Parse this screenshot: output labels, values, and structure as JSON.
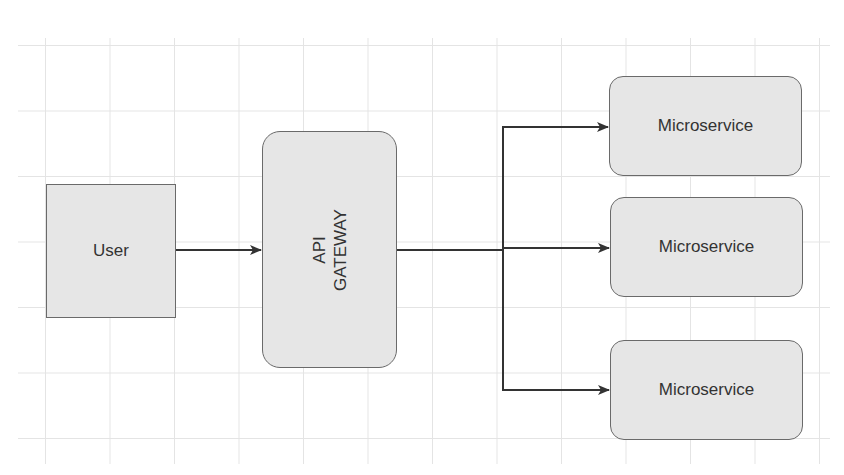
{
  "diagram": {
    "type": "architecture",
    "nodes": [
      {
        "id": "user",
        "label": "User",
        "shape": "rectangle"
      },
      {
        "id": "gateway",
        "label_line1": "API",
        "label_line2": "GATEWAY",
        "shape": "rounded-rectangle",
        "text_orientation": "vertical"
      },
      {
        "id": "ms1",
        "label": "Microservice",
        "shape": "rounded-rectangle"
      },
      {
        "id": "ms2",
        "label": "Microservice",
        "shape": "rounded-rectangle"
      },
      {
        "id": "ms3",
        "label": "Microservice",
        "shape": "rounded-rectangle"
      }
    ],
    "edges": [
      {
        "from": "user",
        "to": "gateway"
      },
      {
        "from": "gateway",
        "to": "ms1"
      },
      {
        "from": "gateway",
        "to": "ms2"
      },
      {
        "from": "gateway",
        "to": "ms3"
      }
    ]
  },
  "colors": {
    "node_fill": "#e6e6e6",
    "node_border": "#6a6a6a",
    "edge": "#333333",
    "grid": "#e4e4e4"
  }
}
